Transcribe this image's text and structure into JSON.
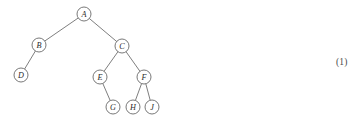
{
  "figure": {
    "kind": "binary-tree-diagram",
    "width": 361,
    "height": 119,
    "background_color": "#ffffff",
    "edge_color": "#6f6f6f",
    "node_stroke_color": "#6a6a6a",
    "node_fill_color": "#ffffff",
    "label_color": "#2b2b2b",
    "node_radius": 7
  },
  "equation_number": {
    "text": "(1)",
    "color": "#4a4a4a"
  },
  "nodes": [
    {
      "id": "A",
      "label": "A",
      "cx": 84,
      "cy": 14
    },
    {
      "id": "B",
      "label": "B",
      "cx": 39,
      "cy": 45
    },
    {
      "id": "C",
      "label": "C",
      "cx": 122,
      "cy": 46
    },
    {
      "id": "D",
      "label": "D",
      "cx": 21,
      "cy": 75
    },
    {
      "id": "E",
      "label": "E",
      "cx": 100,
      "cy": 77
    },
    {
      "id": "F",
      "label": "F",
      "cx": 144,
      "cy": 77
    },
    {
      "id": "G",
      "label": "G",
      "cx": 113,
      "cy": 107
    },
    {
      "id": "H",
      "label": "H",
      "cx": 133,
      "cy": 107
    },
    {
      "id": "J",
      "label": "J",
      "cx": 152,
      "cy": 107
    }
  ],
  "edges": [
    {
      "from": "A",
      "to": "B"
    },
    {
      "from": "A",
      "to": "C"
    },
    {
      "from": "B",
      "to": "D"
    },
    {
      "from": "C",
      "to": "E"
    },
    {
      "from": "C",
      "to": "F"
    },
    {
      "from": "E",
      "to": "G"
    },
    {
      "from": "F",
      "to": "H"
    },
    {
      "from": "F",
      "to": "J"
    }
  ]
}
